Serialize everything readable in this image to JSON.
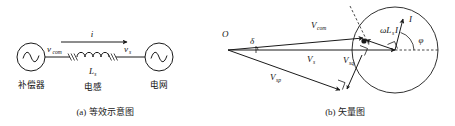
{
  "figure": {
    "panels": [
      {
        "id": "panel-a",
        "caption": "(a) 等效示意图",
        "type": "equivalent-circuit",
        "labels": {
          "source_left": "补偿器",
          "source_right": "电网",
          "voltage_left": "v",
          "voltage_left_sub": "com",
          "voltage_right": "v",
          "voltage_right_sub": "s",
          "inductor": "L",
          "inductor_sub": "s",
          "inductor_name": "电感",
          "current": "i"
        }
      },
      {
        "id": "panel-b",
        "caption": "(b) 矢量图",
        "type": "phasor-vector-diagram",
        "labels": {
          "origin": "O",
          "angle_delta": "δ",
          "angle_phi": "φ",
          "v_com": "V",
          "v_com_sub": "com",
          "v_s": "V",
          "v_s_sub": "s",
          "v_sq": "V",
          "v_sq_sub": "sq",
          "v_sp": "V",
          "v_sp_sub": "sp",
          "reactance_drop": "ωL",
          "reactance_drop_sub": "s",
          "reactance_drop_tail": "I",
          "current": "I"
        }
      }
    ],
    "colors": {
      "ink": "#1a1a1a",
      "background": "#ffffff"
    }
  }
}
